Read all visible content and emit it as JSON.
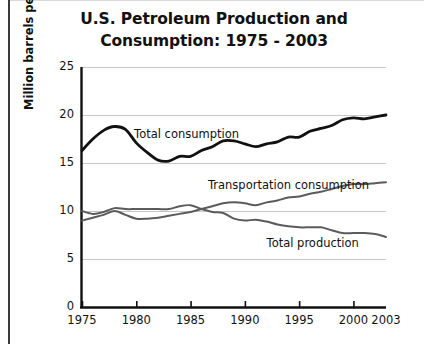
{
  "chart_data": {
    "type": "line",
    "title": "U.S. Petroleum Production and Consumption: 1975 - 2003",
    "title_line1": "U.S. Petroleum Production and",
    "title_line2": "Consumption: 1975 - 2003",
    "xlabel": "",
    "ylabel": "Million barrels per day",
    "xlim": [
      1975,
      2003
    ],
    "ylim": [
      0,
      25
    ],
    "grid": true,
    "legend_position": "inline-labels",
    "yticks": [
      "0",
      "5",
      "10",
      "15",
      "20",
      "25"
    ],
    "ytick_values": [
      0,
      5,
      10,
      15,
      20,
      25
    ],
    "xticks": [
      "1975",
      "1980",
      "1985",
      "1990",
      "1995",
      "2000",
      "2003"
    ],
    "xtick_values": [
      1975,
      1980,
      1985,
      1990,
      1995,
      2000,
      2003
    ],
    "x": [
      1975,
      1976,
      1977,
      1978,
      1979,
      1980,
      1981,
      1982,
      1983,
      1984,
      1985,
      1986,
      1987,
      1988,
      1989,
      1990,
      1991,
      1992,
      1993,
      1994,
      1995,
      1996,
      1997,
      1998,
      1999,
      2000,
      2001,
      2002,
      2003
    ],
    "series": [
      {
        "name": "Total consumption",
        "color": "#111111",
        "width": 2.8,
        "label_x": 1979.8,
        "label_y": 17.9,
        "values": [
          16.3,
          17.5,
          18.4,
          18.8,
          18.5,
          17.1,
          16.1,
          15.3,
          15.2,
          15.7,
          15.7,
          16.3,
          16.7,
          17.3,
          17.3,
          17.0,
          16.7,
          17.0,
          17.2,
          17.7,
          17.7,
          18.3,
          18.6,
          18.9,
          19.5,
          19.7,
          19.6,
          19.8,
          20.0
        ]
      },
      {
        "name": "Transportation consumption",
        "color": "#5b5b5b",
        "width": 2.0,
        "label_x": 1986.6,
        "label_y": 12.6,
        "values": [
          9.0,
          9.3,
          9.6,
          10.0,
          9.6,
          9.2,
          9.2,
          9.3,
          9.5,
          9.7,
          9.9,
          10.2,
          10.5,
          10.8,
          10.9,
          10.8,
          10.6,
          10.9,
          11.1,
          11.4,
          11.5,
          11.8,
          12.0,
          12.3,
          12.6,
          12.8,
          12.8,
          12.9,
          13.0
        ]
      },
      {
        "name": "Total production",
        "color": "#5b5b5b",
        "width": 2.0,
        "label_x": 1992.0,
        "label_y": 6.6,
        "values": [
          10.0,
          9.7,
          9.9,
          10.3,
          10.2,
          10.2,
          10.2,
          10.2,
          10.2,
          10.5,
          10.6,
          10.2,
          9.9,
          9.8,
          9.2,
          9.0,
          9.1,
          8.9,
          8.6,
          8.4,
          8.3,
          8.3,
          8.3,
          8.0,
          7.7,
          7.7,
          7.7,
          7.6,
          7.3
        ]
      }
    ]
  },
  "axes": {
    "y_axis_title": "Million barrels per day"
  }
}
